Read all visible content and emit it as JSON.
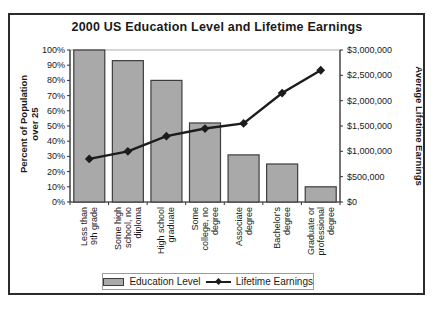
{
  "chart_data": {
    "type": "combo",
    "title": "2000 US Education Level and Lifetime Earnings",
    "categories": [
      [
        "Less than",
        "9th grade"
      ],
      [
        "Some high",
        "school, no",
        "diploma"
      ],
      [
        "High school",
        "graduate"
      ],
      [
        "Some",
        "college, no",
        "degree"
      ],
      [
        "Associate",
        "degree"
      ],
      [
        "Bachelor's",
        "degree"
      ],
      [
        "Graduate or",
        "professional",
        "degree"
      ]
    ],
    "series": [
      {
        "name": "Education Level",
        "type": "bar",
        "axis": "left",
        "values": [
          100,
          93,
          80,
          52,
          31,
          25,
          10
        ],
        "unit": "percent"
      },
      {
        "name": "Lifetime Earnings",
        "type": "line",
        "axis": "right",
        "values": [
          850000,
          1000000,
          1300000,
          1450000,
          1550000,
          2150000,
          2600000
        ],
        "unit": "USD"
      }
    ],
    "left_axis": {
      "title": "Percent of Population over 25",
      "min": 0,
      "max": 100,
      "tick_step": 10,
      "format": "percent"
    },
    "right_axis": {
      "title": "Average Lifetime Earnings",
      "min": 0,
      "max": 3000000,
      "tick_step": 500000,
      "format": "usd"
    },
    "legend": {
      "position": "bottom",
      "entries": [
        "Education Level",
        "Lifetime Earnings"
      ]
    },
    "grid": false
  },
  "colors": {
    "bar_fill": "#a9a9a9",
    "bar_stroke": "#3d3d3d",
    "line": "#1c1c1c",
    "text": "#1a1a1a",
    "plot_border": "#999999",
    "axis": "#333333"
  }
}
